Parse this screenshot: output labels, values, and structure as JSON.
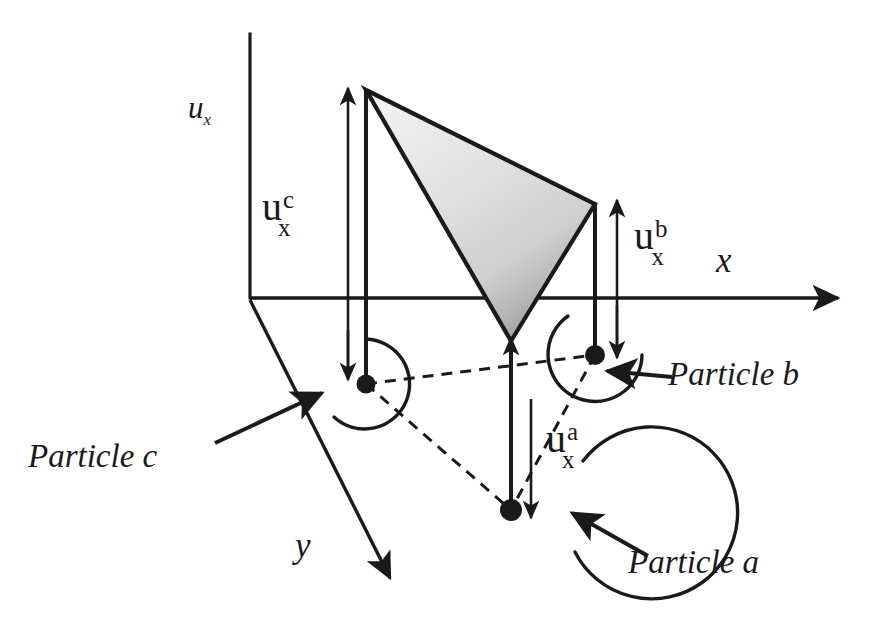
{
  "figure": {
    "caption_absent": true,
    "background_color": "#ffffff",
    "line_color": "#1a1a1a",
    "shape_fill_light": "#f2f2f2",
    "shape_fill_dark": "#9a9a9a"
  },
  "axes": {
    "vertical": {
      "name": "ux-axis",
      "label_main": "u",
      "label_sub": "x",
      "description": "vertical displacement axis"
    },
    "horizontal": {
      "name": "x-axis",
      "label": "x"
    },
    "depth": {
      "name": "y-axis",
      "label": "y"
    }
  },
  "vectors": [
    {
      "id": "uxc",
      "main": "u",
      "sup": "c",
      "sub": "x",
      "direction": "up",
      "particle": "c"
    },
    {
      "id": "uxb",
      "main": "u",
      "sup": "b",
      "sub": "x",
      "direction": "up",
      "particle": "b"
    },
    {
      "id": "uxa",
      "main": "u",
      "sup": "a",
      "sub": "x",
      "direction": "down",
      "particle": "a"
    }
  ],
  "particles": [
    {
      "id": "a",
      "label": "Particle a",
      "circle_radius_px": 86,
      "has_leader_arrow": true
    },
    {
      "id": "b",
      "label": "Particle b",
      "circle_radius_px": 47,
      "has_leader_arrow": true
    },
    {
      "id": "c",
      "label": "Particle c",
      "circle_radius_px": 45,
      "has_leader_arrow": true
    }
  ],
  "element": {
    "name": "shaded-triangle",
    "vertex_count": 3,
    "fill_style": "gradient-light-to-grey",
    "description": "triangular element spanning the three particle displacement tips"
  },
  "connectors": {
    "style": "dashed",
    "description": "dashed lines joining particle centres"
  }
}
